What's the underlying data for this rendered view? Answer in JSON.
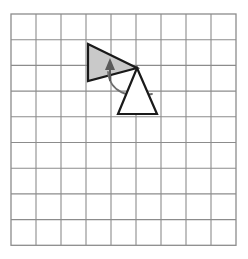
{
  "figure": {
    "canvas": {
      "width": 248,
      "height": 259,
      "background": "#ffffff"
    }
  },
  "grid": {
    "name": "square-grid",
    "columns": 9,
    "rows": 9,
    "origin_x": 11,
    "origin_y": 14,
    "cell_width": 25,
    "cell_height": 25.7,
    "line_color": "#8c8c8c",
    "line_width": 1.1,
    "border_color": "#8c8c8c",
    "border_width": 1.3,
    "fill": "#ffffff"
  },
  "shapes": {
    "preimage_triangle": {
      "label": "shaded triangle (pre-image)",
      "points": "88,44 137,68 88,81",
      "fill": "#c9c9c9",
      "stroke": "#1a1a1a",
      "stroke_width": 2.2
    },
    "image_triangle": {
      "label": "open triangle (image)",
      "points": "137,68 157,114 118,114",
      "fill": "#ffffff",
      "stroke": "#1a1a1a",
      "stroke_width": 2.2
    }
  },
  "annotations": {
    "direction_arrow": {
      "label": "upward direction arrow inside shaded triangle",
      "shaft_path": "M 110,81 L 110,64",
      "head_points": "110,58 115,70 105,70",
      "color": "#5a5a5a",
      "stroke_width": 2.0
    },
    "rotation_arc": {
      "label": "curved rotation arc",
      "path": "M 108,72 C 110,92 128,99 152,94",
      "color": "#6e6e6e",
      "stroke_width": 1.8
    },
    "pivot_point": {
      "label": "shared vertex / center of rotation",
      "x": 137,
      "y": 68
    }
  }
}
